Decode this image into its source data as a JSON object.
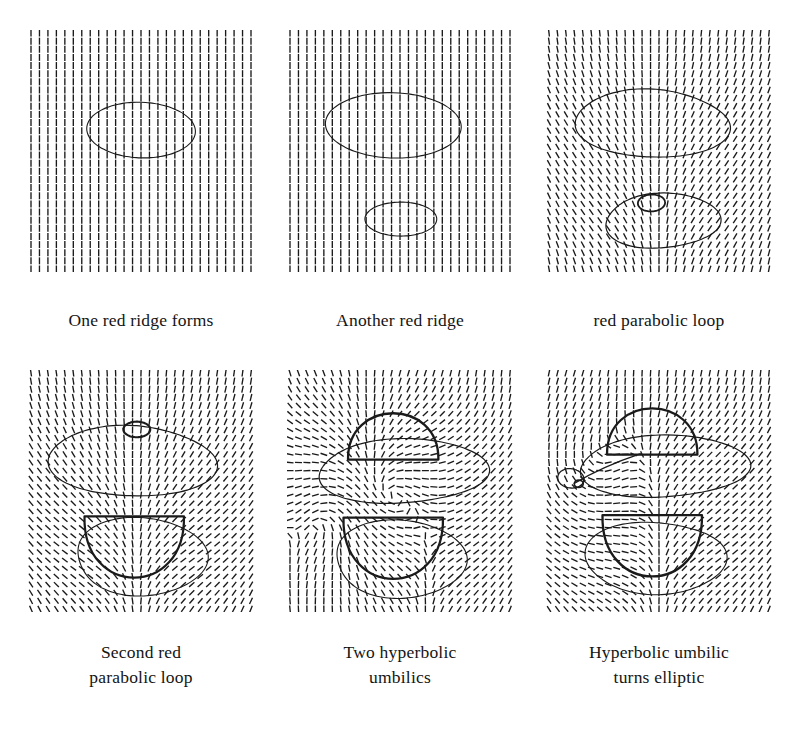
{
  "figure": {
    "background_color": "#ffffff",
    "ink_color": "#1a1a1a",
    "rows": 2,
    "columns": 3
  },
  "chart_data": {
    "type": "line",
    "xlabel": "",
    "ylabel": "",
    "grid": false,
    "legend_position": "none",
    "panel_layout": {
      "rows": 2,
      "cols": 3
    },
    "panels": [
      {
        "index": 1,
        "caption_lines": [
          "One red ridge forms"
        ],
        "field": {
          "type": "line-field",
          "glyph": "short-dash",
          "nx": 27,
          "ny": 30,
          "base_angle_deg": 90,
          "description": "Nearly uniform vertical line field with slight tilt at upper-left corner"
        },
        "curves": [
          {
            "name": "red-ridge-loop-upper",
            "kind": "closed-ellipse",
            "stroke_width": 1.1,
            "cx_frac": 0.5,
            "cy_frac": 0.41,
            "rx_frac": 0.24,
            "ry_frac": 0.115
          }
        ],
        "umbilics": []
      },
      {
        "index": 2,
        "caption_lines": [
          "Another red ridge"
        ],
        "field": {
          "type": "line-field",
          "glyph": "short-dash",
          "nx": 27,
          "ny": 30,
          "base_angle_deg": 90,
          "description": "Vertical line field with mild convergence between the two loops"
        },
        "curves": [
          {
            "name": "red-ridge-loop-upper",
            "kind": "closed-ellipse",
            "stroke_width": 1.1,
            "cx_frac": 0.47,
            "cy_frac": 0.39,
            "rx_frac": 0.3,
            "ry_frac": 0.135
          },
          {
            "name": "red-ridge-loop-lower",
            "kind": "closed-ellipse",
            "stroke_width": 1.1,
            "cx_frac": 0.5,
            "cy_frac": 0.78,
            "rx_frac": 0.155,
            "ry_frac": 0.072
          }
        ],
        "umbilics": []
      },
      {
        "index": 3,
        "caption_lines": [
          "red parabolic loop"
        ],
        "field": {
          "type": "line-field",
          "glyph": "short-dash",
          "nx": 27,
          "ny": 30,
          "base_angle_deg": 90,
          "description": "Vertical field fanning inward in the band between the loops"
        },
        "curves": [
          {
            "name": "red-ridge-blob-upper",
            "kind": "closed-blob",
            "stroke_width": 1.2,
            "cx_frac": 0.46,
            "cy_frac": 0.38,
            "rx_frac": 0.33,
            "ry_frac": 0.145
          },
          {
            "name": "red-ridge-blob-lower",
            "kind": "closed-blob",
            "stroke_width": 1.2,
            "cx_frac": 0.5,
            "cy_frac": 0.79,
            "rx_frac": 0.25,
            "ry_frac": 0.115
          },
          {
            "name": "parabolic-loop-small",
            "kind": "closed-ellipse",
            "stroke_width": 1.8,
            "cx_frac": 0.465,
            "cy_frac": 0.715,
            "rx_frac": 0.06,
            "ry_frac": 0.035
          }
        ],
        "umbilics": []
      },
      {
        "index": 4,
        "caption_lines": [
          "Second red",
          "parabolic loop"
        ],
        "field": {
          "type": "line-field",
          "glyph": "short-dash",
          "nx": 27,
          "ny": 30,
          "base_angle_deg": 90,
          "description": "Vertical field swirling strongly inside both blobs"
        },
        "curves": [
          {
            "name": "red-ridge-blob-upper",
            "kind": "closed-blob",
            "stroke_width": 1.2,
            "cx_frac": 0.45,
            "cy_frac": 0.37,
            "rx_frac": 0.36,
            "ry_frac": 0.15
          },
          {
            "name": "parabolic-loop-small-upper",
            "kind": "closed-ellipse",
            "stroke_width": 2.1,
            "cx_frac": 0.48,
            "cy_frac": 0.245,
            "rx_frac": 0.058,
            "ry_frac": 0.033
          },
          {
            "name": "red-ridge-blob-lower-outer",
            "kind": "closed-blob",
            "stroke_width": 1.1,
            "cx_frac": 0.5,
            "cy_frac": 0.78,
            "rx_frac": 0.3,
            "ry_frac": 0.155
          },
          {
            "name": "parabolic-loop-lower-inner",
            "kind": "closed-arc-bowl",
            "stroke_width": 2.2,
            "cx_frac": 0.47,
            "cy_frac": 0.73,
            "rx_frac": 0.22,
            "ry_frac": 0.125
          }
        ],
        "umbilics": []
      },
      {
        "index": 5,
        "caption_lines": [
          "Two hyperbolic",
          "umbilics"
        ],
        "field": {
          "type": "line-field",
          "glyph": "short-dash",
          "nx": 27,
          "ny": 30,
          "base_angle_deg": 90,
          "description": "Vertical field with two hyperbolic index -1/2 singular points"
        },
        "curves": [
          {
            "name": "ridge-cap-upper",
            "kind": "closed-arc-cap",
            "stroke_width": 2.3,
            "cx_frac": 0.47,
            "cy_frac": 0.27,
            "rx_frac": 0.2,
            "ry_frac": 0.1
          },
          {
            "name": "ridge-lobe-upper-wide",
            "kind": "closed-blob",
            "stroke_width": 1.2,
            "cx_frac": 0.49,
            "cy_frac": 0.42,
            "rx_frac": 0.37,
            "ry_frac": 0.135
          },
          {
            "name": "ridge-lobe-lower-outer",
            "kind": "closed-blob",
            "stroke_width": 1.1,
            "cx_frac": 0.5,
            "cy_frac": 0.79,
            "rx_frac": 0.3,
            "ry_frac": 0.155
          },
          {
            "name": "ridge-bowl-lower-inner",
            "kind": "closed-arc-bowl",
            "stroke_width": 2.3,
            "cx_frac": 0.47,
            "cy_frac": 0.735,
            "rx_frac": 0.22,
            "ry_frac": 0.125
          }
        ],
        "umbilics": [
          {
            "name": "hyperbolic-umbilic-upper",
            "type": "hyperbolic",
            "cx_frac": 0.3,
            "cy_frac": 0.5
          },
          {
            "name": "hyperbolic-umbilic-lower",
            "type": "hyperbolic",
            "cx_frac": 0.35,
            "cy_frac": 0.56
          }
        ]
      },
      {
        "index": 6,
        "caption_lines": [
          "Hyperbolic umbilic",
          "turns elliptic"
        ],
        "field": {
          "type": "line-field",
          "glyph": "short-dash",
          "nx": 27,
          "ny": 30,
          "base_angle_deg": 90,
          "description": "Vertical field with an elliptic index +1/2 singular point at left"
        },
        "curves": [
          {
            "name": "ridge-cap-upper",
            "kind": "closed-arc-cap",
            "stroke_width": 2.3,
            "cx_frac": 0.47,
            "cy_frac": 0.25,
            "rx_frac": 0.2,
            "ry_frac": 0.1
          },
          {
            "name": "ridge-lobe-upper-wide",
            "kind": "closed-blob",
            "stroke_width": 1.2,
            "cx_frac": 0.5,
            "cy_frac": 0.4,
            "rx_frac": 0.37,
            "ry_frac": 0.13
          },
          {
            "name": "elliptic-umbilic-loop",
            "kind": "closed-ellipse-small",
            "stroke_width": 1.3,
            "cx_frac": 0.115,
            "cy_frac": 0.45,
            "rx_frac": 0.055,
            "ry_frac": 0.042
          },
          {
            "name": "ridge-lobe-lower-outer",
            "kind": "closed-blob",
            "stroke_width": 1.1,
            "cx_frac": 0.5,
            "cy_frac": 0.78,
            "rx_frac": 0.3,
            "ry_frac": 0.155
          },
          {
            "name": "ridge-bowl-lower-inner",
            "kind": "closed-arc-bowl",
            "stroke_width": 2.3,
            "cx_frac": 0.47,
            "cy_frac": 0.725,
            "rx_frac": 0.22,
            "ry_frac": 0.125
          }
        ],
        "umbilics": [
          {
            "name": "elliptic-umbilic",
            "type": "elliptic",
            "cx_frac": 0.145,
            "cy_frac": 0.47
          }
        ]
      }
    ]
  },
  "captions": {
    "panel1": [
      "One red ridge forms"
    ],
    "panel2": [
      "Another red ridge"
    ],
    "panel3": [
      "red parabolic loop"
    ],
    "panel4": [
      "Second red",
      "parabolic loop"
    ],
    "panel5": [
      "Two hyperbolic",
      "umbilics"
    ],
    "panel6": [
      "Hyperbolic umbilic",
      "turns elliptic"
    ]
  }
}
